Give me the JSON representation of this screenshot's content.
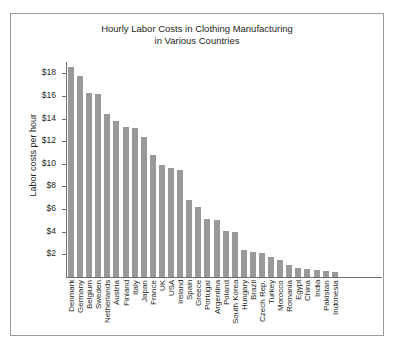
{
  "chart_data": {
    "type": "bar",
    "title": "Hourly Labor Costs in Clothing Manufacturing\nin Various Countries",
    "xlabel": "",
    "ylabel": "Labor costs per hour",
    "ylim": [
      0,
      19
    ],
    "grid": false,
    "legend": "none",
    "y_ticks": [
      "$2",
      "$4",
      "$6",
      "$8",
      "$10",
      "$12",
      "$14",
      "$16",
      "$18"
    ],
    "y_tick_values": [
      2,
      4,
      6,
      8,
      10,
      12,
      14,
      16,
      18
    ],
    "categories": [
      "Denmark",
      "Germany",
      "Belgium",
      "Sweden",
      "Netherlands",
      "Austria",
      "Finland",
      "Italy",
      "Japan",
      "France",
      "UK",
      "USA",
      "Ireland",
      "Spain",
      "Greece",
      "Portugal",
      "Argentina",
      "Poland",
      "South Korea",
      "Hungary",
      "Brazil",
      "Czech Rep.",
      "Turkey",
      "Morocco",
      "Romania",
      "Egypt",
      "China",
      "India",
      "Pakistan",
      "Indonesia"
    ],
    "values": [
      18.6,
      17.8,
      16.3,
      16.2,
      14.4,
      13.8,
      13.3,
      13.2,
      12.4,
      10.8,
      9.9,
      9.6,
      9.5,
      6.8,
      6.2,
      5.1,
      5.0,
      4.1,
      4.0,
      2.4,
      2.2,
      2.1,
      1.8,
      1.5,
      1.1,
      0.8,
      0.7,
      0.6,
      0.5,
      0.4
    ]
  },
  "style": {
    "bar_color": "#999999",
    "axis_color": "#6d6e71",
    "frame_color": "#9a9a9a",
    "text_color": "#231f20",
    "background": "#ffffff"
  }
}
